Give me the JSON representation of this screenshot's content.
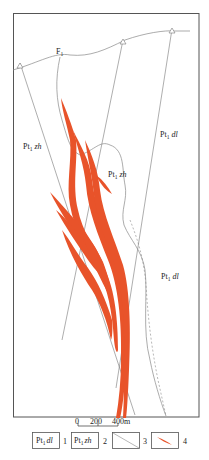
{
  "figure": {
    "type": "geological-map",
    "frame": {
      "left": 13,
      "top": 13,
      "right": 199,
      "bottom": 417
    }
  },
  "fault": {
    "label": "F",
    "subscript": "1"
  },
  "units": [
    {
      "code": "Pt",
      "sub": "1",
      "name": "zh",
      "x": 23,
      "y": 149
    },
    {
      "code": "Pt",
      "sub": "1",
      "name": "dl",
      "x": 160,
      "y": 137
    },
    {
      "code": "Pt",
      "sub": "1",
      "name": "zh",
      "x": 108,
      "y": 177
    },
    {
      "code": "Pt",
      "sub": "1",
      "name": "dl",
      "x": 161,
      "y": 279
    }
  ],
  "scale_bar": {
    "ticks": [
      "0",
      "200",
      "400m"
    ]
  },
  "legend": [
    {
      "num": "1",
      "kind": "unit",
      "code": "Pt",
      "sub": "1",
      "name": "dl"
    },
    {
      "num": "2",
      "kind": "unit",
      "code": "Pt",
      "sub": "1",
      "name": "zh"
    },
    {
      "num": "3",
      "kind": "line-symbol"
    },
    {
      "num": "4",
      "kind": "orebody-symbol"
    }
  ],
  "colors": {
    "orebody": "#e8532a",
    "line": "#7a7a7a",
    "frame": "#555555"
  }
}
